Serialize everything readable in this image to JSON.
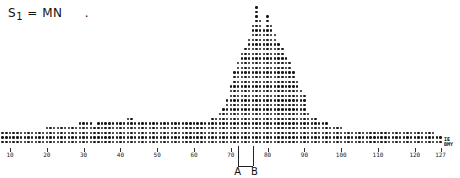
{
  "title": {
    "symbol": "S",
    "subscript": "1",
    "rest": "= MN",
    "trail": "."
  },
  "markers": {
    "a": "A",
    "b": "B",
    "a_x": 72,
    "b_x": 76
  },
  "end_label": [
    "IE",
    "BMY"
  ],
  "chart_data": {
    "type": "bar",
    "style": "dot histogram (line-printer)",
    "title": "S1 = MN",
    "xlabel": "",
    "ylabel": "",
    "x_ticks": [
      10,
      20,
      30,
      40,
      50,
      60,
      70,
      80,
      90,
      100,
      110,
      120,
      127
    ],
    "xlim": [
      1,
      127
    ],
    "grid": false,
    "annotations": [
      {
        "label": "A",
        "x": 72
      },
      {
        "label": "B",
        "x": 76
      }
    ],
    "x": [
      1,
      2,
      3,
      4,
      5,
      6,
      7,
      8,
      9,
      10,
      11,
      12,
      13,
      14,
      15,
      16,
      17,
      18,
      19,
      20,
      21,
      22,
      23,
      24,
      25,
      26,
      27,
      28,
      29,
      30,
      31,
      32,
      33,
      34,
      35,
      36,
      37,
      38,
      39,
      40,
      41,
      42,
      43,
      44,
      45,
      46,
      47,
      48,
      49,
      50,
      51,
      52,
      53,
      54,
      55,
      56,
      57,
      58,
      59,
      60,
      61,
      62,
      63,
      64,
      65,
      66,
      67,
      68,
      69,
      70,
      71,
      72,
      73,
      74,
      75,
      76,
      77,
      78,
      79,
      80,
      81,
      82,
      83,
      84,
      85,
      86,
      87,
      88,
      89,
      90,
      91,
      92,
      93,
      94,
      95,
      96,
      97,
      98,
      99,
      100,
      101,
      102,
      103,
      104,
      105,
      106,
      107,
      108,
      109,
      110,
      111,
      112,
      113,
      114,
      115,
      116,
      117,
      118,
      119,
      120,
      121,
      122,
      123,
      124,
      125,
      126,
      127
    ],
    "values": [
      3,
      3,
      3,
      3,
      3,
      3,
      3,
      3,
      3,
      3,
      3,
      3,
      3,
      3,
      3,
      3,
      3,
      3,
      3,
      4,
      4,
      4,
      4,
      4,
      4,
      4,
      4,
      4,
      5,
      5,
      5,
      5,
      4,
      5,
      5,
      5,
      5,
      5,
      5,
      5,
      5,
      6,
      6,
      5,
      5,
      5,
      5,
      5,
      5,
      5,
      5,
      5,
      5,
      5,
      5,
      5,
      5,
      5,
      5,
      5,
      5,
      5,
      5,
      5,
      6,
      6,
      7,
      8,
      10,
      13,
      16,
      18,
      20,
      21,
      23,
      26,
      30,
      27,
      25,
      28,
      26,
      24,
      22,
      21,
      19,
      18,
      16,
      14,
      12,
      11,
      7,
      6,
      6,
      5,
      5,
      5,
      4,
      4,
      4,
      4,
      3,
      3,
      3,
      3,
      3,
      3,
      3,
      3,
      3,
      3,
      3,
      3,
      3,
      3,
      3,
      3,
      3,
      3,
      3,
      3,
      3,
      3,
      3,
      3,
      3,
      2,
      2
    ]
  }
}
